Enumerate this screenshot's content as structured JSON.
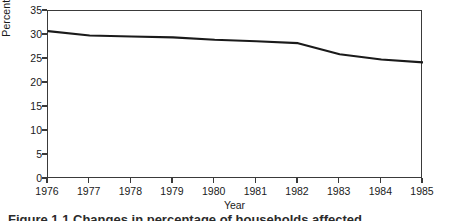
{
  "chart_data": {
    "type": "line",
    "title": "",
    "xlabel": "Year",
    "ylabel": "Percentage of households affected",
    "x": [
      1976,
      1977,
      1978,
      1979,
      1980,
      1981,
      1982,
      1983,
      1984,
      1985
    ],
    "xticklabels": [
      "1976",
      "1977",
      "1978",
      "1979",
      "1980",
      "1981",
      "1982",
      "1983",
      "1984",
      "1985"
    ],
    "yticks": [
      0,
      5,
      10,
      15,
      20,
      25,
      30,
      35
    ],
    "yticklabels": [
      "0",
      "5",
      "10",
      "15",
      "20",
      "25",
      "30",
      "35"
    ],
    "xlim": [
      1976,
      1985
    ],
    "ylim": [
      0,
      35
    ],
    "grid": false,
    "legend": null,
    "series": [
      {
        "name": "Percentage of households affected",
        "color": "#1a1a1a",
        "values": [
          30.8,
          29.9,
          29.7,
          29.5,
          29.0,
          28.7,
          28.3,
          26.0,
          24.9,
          24.3
        ]
      }
    ]
  },
  "caption": {
    "text": "Figure 1.1  Changes in percentage of households affected"
  },
  "colors": {
    "line": "#1a1a1a",
    "axis": "#3a3a3a",
    "background": "#ffffff"
  }
}
